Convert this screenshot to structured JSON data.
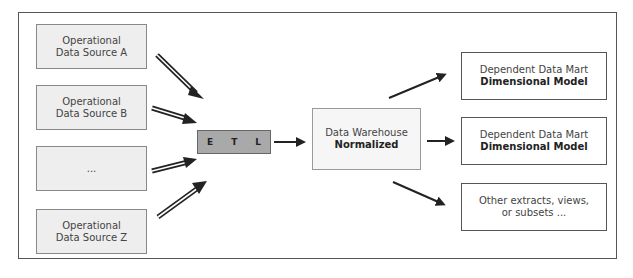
{
  "diagram": {
    "type": "data-warehouse-architecture",
    "sources": [
      {
        "line1": "Operational",
        "line2": "Data Source A"
      },
      {
        "line1": "Operational",
        "line2": "Data Source B"
      },
      {
        "line1": "...",
        "line2": ""
      },
      {
        "line1": "Operational",
        "line2": "Data Source Z"
      }
    ],
    "etl": {
      "e": "E",
      "t": "T",
      "l": "L"
    },
    "warehouse": {
      "line1": "Data Warehouse",
      "line2": "Normalized"
    },
    "targets": [
      {
        "line1": "Dependent Data Mart",
        "line2": "Dimensional Model",
        "line2_bold": true
      },
      {
        "line1": "Dependent Data Mart",
        "line2": "Dimensional Model",
        "line2_bold": true
      },
      {
        "line1": "Other extracts, views,",
        "line2": "or subsets ...",
        "line2_bold": false
      }
    ],
    "colors": {
      "source_fill": "#eeeeee",
      "etl_fill": "#a9a9a9",
      "warehouse_fill": "#f6f6f6",
      "mart_fill": "#ffffff",
      "arrow": "#222222",
      "border": "#555555"
    }
  }
}
